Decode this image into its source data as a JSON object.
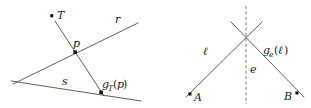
{
  "figure": {
    "title": "",
    "background_color": "#ffffff",
    "line_color": "#4d4d4d",
    "dash_color": "#6b6b6b",
    "point_color": "#111111",
    "panels": [
      {
        "id": "left-panel",
        "name": "point-reflection-diagram",
        "labels": {
          "t": "T",
          "r": "r",
          "p": "p",
          "s": "s",
          "g_base": "g",
          "g_sub": "T",
          "g_open": "(",
          "g_arg": "p",
          "g_close": ")"
        },
        "points": [
          {
            "name": "point-T",
            "label": "T",
            "x": 52,
            "y": 16
          },
          {
            "name": "point-p",
            "label": "p",
            "x": 75,
            "y": 52
          },
          {
            "name": "point-gTp",
            "label": "gT(p)",
            "x": 101,
            "y": 92
          }
        ]
      },
      {
        "id": "right-panel",
        "name": "line-reflection-diagram",
        "labels": {
          "ell": "ℓ",
          "e": "e",
          "a": "A",
          "b": "B",
          "g_base": "g",
          "g_sub": "e",
          "g_open": "(",
          "g_arg": "ℓ",
          "g_close": ")"
        },
        "points": [
          {
            "name": "point-A",
            "label": "A",
            "x": 190,
            "y": 94
          },
          {
            "name": "point-B",
            "label": "B",
            "x": 297,
            "y": 93
          }
        ]
      }
    ]
  }
}
